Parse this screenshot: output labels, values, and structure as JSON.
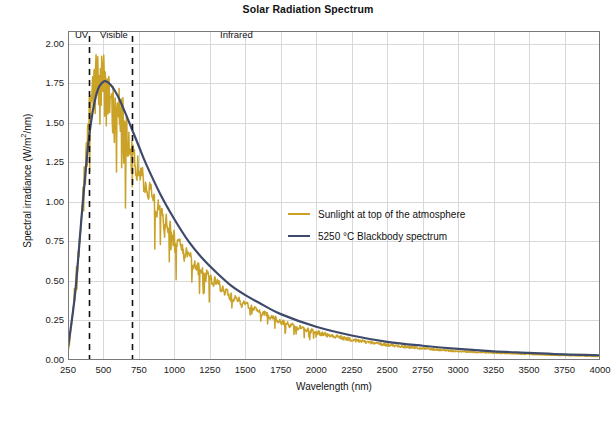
{
  "figure": {
    "title": "Solar Radiation Spectrum",
    "caption": ""
  },
  "axes": {
    "xlabel": "Wavelength (nm)",
    "ylabel_prefix": "Spectral irradiance (W/m",
    "ylabel_sup": "2",
    "ylabel_suffix": "/nm)",
    "xticks": [
      "250",
      "500",
      "750",
      "1000",
      "1250",
      "1500",
      "1750",
      "2000",
      "2250",
      "2500",
      "2750",
      "3000",
      "3250",
      "3500",
      "3750",
      "4000"
    ],
    "yticks": [
      "2.00",
      "1.75",
      "1.50",
      "1.25",
      "1.00",
      "0.75",
      "0.50",
      "0.25",
      "0.00"
    ]
  },
  "bands": [
    {
      "label": "UV",
      "x": 400
    },
    {
      "label": "Visible",
      "x": 510
    },
    {
      "label": "Infrared",
      "x": 1500
    }
  ],
  "legend": [
    {
      "label": "Sunlight at top of the atmosphere",
      "color": "#c9a227"
    },
    {
      "label": "5250 °C Blackbody spectrum",
      "color": "#3f4a6b"
    }
  ],
  "colors": {
    "sunlight": "#c9a227",
    "blackbody": "#3f4a6b",
    "grid": "#d9d9d9",
    "axis": "#7a7a7a",
    "dashed": "#111111",
    "background": "#ffffff"
  },
  "chart_data": {
    "type": "line",
    "title": "Solar Radiation Spectrum",
    "xlabel": "Wavelength (nm)",
    "ylabel": "Spectral irradiance (W/m2/nm)",
    "xlim": [
      250,
      4000
    ],
    "ylim": [
      0.0,
      2.08
    ],
    "grid": true,
    "legend_position": "center",
    "annotations": [
      {
        "text": "UV",
        "x": 400,
        "y": 2.05
      },
      {
        "text": "Visible",
        "x": 510,
        "y": 2.05
      },
      {
        "text": "Infrared",
        "x": 1500,
        "y": 2.05
      },
      {
        "text": "visible-band-start-dashed-line",
        "x": 400
      },
      {
        "text": "visible-band-end-dashed-line",
        "x": 700
      }
    ],
    "series": [
      {
        "name": "5250 °C Blackbody spectrum",
        "color": "#3f4a6b",
        "x": [
          250,
          300,
          350,
          400,
          450,
          500,
          550,
          600,
          650,
          700,
          750,
          800,
          900,
          1000,
          1100,
          1200,
          1300,
          1400,
          1500,
          1600,
          1750,
          2000,
          2250,
          2500,
          2750,
          3000,
          3250,
          3500,
          3750,
          4000
        ],
        "y": [
          0.08,
          0.42,
          0.95,
          1.42,
          1.68,
          1.76,
          1.74,
          1.67,
          1.57,
          1.46,
          1.35,
          1.24,
          1.05,
          0.89,
          0.75,
          0.64,
          0.55,
          0.47,
          0.41,
          0.36,
          0.29,
          0.21,
          0.155,
          0.115,
          0.09,
          0.07,
          0.055,
          0.045,
          0.035,
          0.03
        ]
      },
      {
        "name": "Sunlight at top of the atmosphere",
        "color": "#c9a227",
        "x": [
          250,
          300,
          350,
          400,
          430,
          450,
          470,
          500,
          520,
          550,
          580,
          600,
          650,
          700,
          750,
          800,
          900,
          1000,
          1100,
          1200,
          1300,
          1400,
          1500,
          1600,
          1750,
          2000,
          2250,
          2500,
          2750,
          3000,
          3250,
          3500,
          3750,
          4000
        ],
        "y": [
          0.06,
          0.52,
          1.05,
          1.72,
          1.95,
          2.05,
          1.97,
          2.02,
          1.93,
          1.86,
          1.82,
          1.77,
          1.63,
          1.44,
          1.28,
          1.18,
          1.0,
          0.84,
          0.7,
          0.6,
          0.52,
          0.43,
          0.38,
          0.33,
          0.26,
          0.19,
          0.14,
          0.105,
          0.08,
          0.06,
          0.05,
          0.04,
          0.032,
          0.026
        ]
      }
    ]
  }
}
